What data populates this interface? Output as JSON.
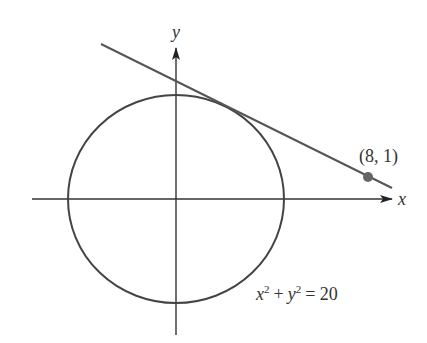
{
  "diagram": {
    "axes": {
      "x_label": "x",
      "y_label": "y"
    },
    "circle": {
      "equation_parts": {
        "x": "x",
        "sup_x": "2",
        "plus": "+",
        "y": "y",
        "sup_y": "2",
        "equals_value": "= 20"
      },
      "equation_text": "x² + y² = 20"
    },
    "point": {
      "label": "(8, 1)",
      "color": "#666666"
    },
    "tangent_line": {
      "description": "tangent line from (8, 1) to circle"
    },
    "colors": {
      "stroke": "#444444",
      "background": "#ffffff"
    }
  }
}
